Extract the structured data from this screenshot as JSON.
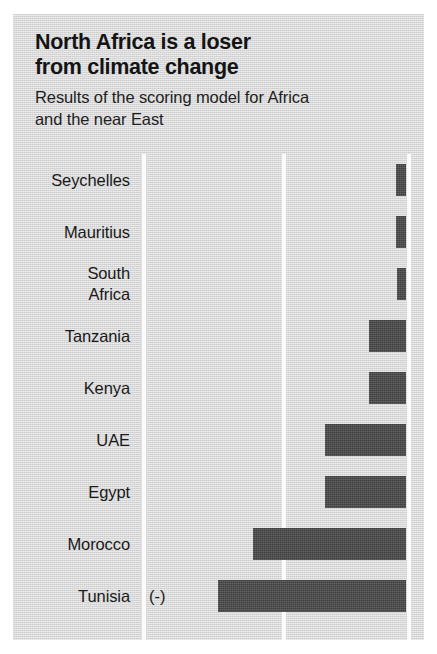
{
  "header": {
    "title": "North Africa is a loser\nfrom climate change",
    "subtitle": "Results of the scoring model for Africa\nand the near East"
  },
  "colors": {
    "panel_background": "#d6d6d6",
    "bar": "#4c4c4c",
    "gridline": "#fbfbfb",
    "text": "#1a1a1a"
  },
  "chart_data": {
    "type": "bar",
    "orientation": "horizontal",
    "title": "North Africa is a loser from climate change",
    "subtitle": "Results of the scoring model for Africa and the near East",
    "xlabel": "",
    "ylabel": "",
    "grid": true,
    "gridline_positions": [
      0.33,
      0.67,
      1.0
    ],
    "legend": "none",
    "note": "Bars are right-anchored; length grows leftward from the right axis. Longer bar = bigger loser.",
    "categories": [
      "Seychelles",
      "Mauritius",
      "South Africa",
      "Tanzania",
      "Kenya",
      "UAE",
      "Egypt",
      "Morocco",
      "Tunisia"
    ],
    "category_display": [
      "Seychelles",
      "Mauritius",
      "South\nAfrica",
      "Tanzania",
      "Kenya",
      "UAE",
      "Egypt",
      "Morocco",
      "Tunisia"
    ],
    "values": [
      10,
      10,
      9,
      37,
      37,
      81,
      81,
      153,
      188
    ],
    "ylim": [
      0,
      196
    ],
    "annotations": [
      {
        "category": "Tunisia",
        "text": "(-)"
      }
    ]
  }
}
